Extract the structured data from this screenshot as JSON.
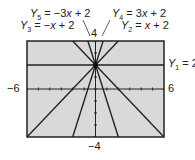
{
  "chart_data": {
    "type": "line",
    "title": "",
    "xlabel": "",
    "ylabel": "",
    "xlim": [
      -6,
      6
    ],
    "ylim": [
      -4,
      4
    ],
    "grid": false,
    "screen_background": "#d9d9d9",
    "line_color": "#222222",
    "tick_labels": {
      "xmin": "−6",
      "xmax": "6",
      "ymin": "−4",
      "ymax": "4"
    },
    "series": [
      {
        "name": "Y1 = 2",
        "slope": 0,
        "intercept": 2
      },
      {
        "name": "Y2 = x + 2",
        "slope": 1,
        "intercept": 2
      },
      {
        "name": "Y3 = −x + 2",
        "slope": -1,
        "intercept": 2
      },
      {
        "name": "Y4 = 3x + 2",
        "slope": 3,
        "intercept": 2
      },
      {
        "name": "Y5 = −3x + 2",
        "slope": -3,
        "intercept": 2
      }
    ]
  },
  "labels": {
    "y5": {
      "sym": "Y",
      "sub": "5",
      "eq": " = −3",
      "var": "x",
      "rest": " + 2"
    },
    "y4": {
      "sym": "Y",
      "sub": "4",
      "eq": " = 3",
      "var": "x",
      "rest": " + 2"
    },
    "y3": {
      "sym": "Y",
      "sub": "3",
      "eq": " = −",
      "var": "x",
      "rest": " + 2"
    },
    "y2": {
      "sym": "Y",
      "sub": "2",
      "eq": " = ",
      "var": "x",
      "rest": " + 2"
    },
    "y1": {
      "sym": "Y",
      "sub": "1",
      "eq": " = 2"
    }
  }
}
